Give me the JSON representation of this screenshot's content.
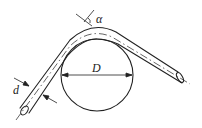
{
  "diagram": {
    "title": "",
    "labels": {
      "tube_diameter": "d",
      "drum_diameter": "D",
      "bend_angle": "α"
    },
    "colors": {
      "stroke": "#222222",
      "background": "#ffffff"
    }
  }
}
